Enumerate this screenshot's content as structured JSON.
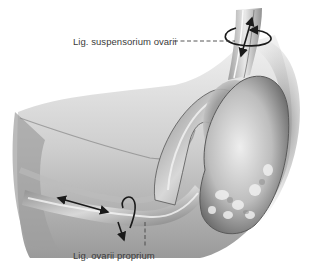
{
  "figure": {
    "style": "grayscale anatomical pencil illustration"
  },
  "labels": [
    {
      "id": "top",
      "text": "Lig. suspensorium ovarii",
      "leader": "dashed horizontal"
    },
    {
      "id": "bottom",
      "text": "Lig. ovarii proprium",
      "leader": "dashed vertical"
    }
  ],
  "annotations": {
    "top_arrows": [
      "double-headed arrow along ligament",
      "rotation arrow around ligament"
    ],
    "bottom_arrows": [
      "double-headed arrow along ligament",
      "rotation arrow around ligament"
    ]
  },
  "colors": {
    "background": "#ffffff",
    "label_text": "#3a3a3a",
    "arrow": "#1a1a1a",
    "tissue_light": "#e6e6e6",
    "tissue_mid": "#a8a8a8",
    "tissue_dark": "#4a4a4a"
  }
}
